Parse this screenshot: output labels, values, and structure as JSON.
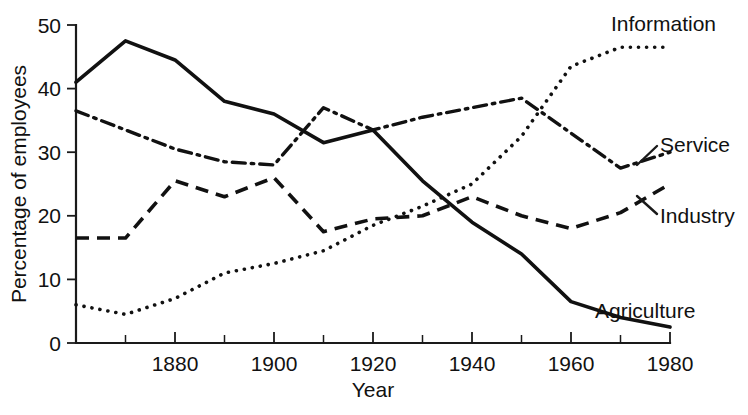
{
  "chart_data": {
    "type": "line",
    "title": "",
    "xlabel": "Year",
    "ylabel": "Percentage of employees",
    "xlim": [
      1860,
      1980
    ],
    "ylim": [
      0,
      50
    ],
    "grid": false,
    "legend_position": "inline-right-labels",
    "x_ticks_major": [
      1880,
      1900,
      1920,
      1940,
      1960,
      1980
    ],
    "x_ticks_minor": [
      1870,
      1890,
      1910,
      1930,
      1950,
      1970
    ],
    "y_ticks": [
      0,
      10,
      20,
      30,
      40,
      50
    ],
    "x": [
      1860,
      1870,
      1880,
      1890,
      1900,
      1910,
      1920,
      1930,
      1940,
      1950,
      1960,
      1970,
      1980
    ],
    "series": [
      {
        "name": "Agriculture",
        "style": "solid",
        "label": "Agriculture",
        "values": [
          41,
          47.5,
          44.5,
          38,
          36,
          31.5,
          33.5,
          25.5,
          19,
          14,
          6.5,
          4,
          2.5
        ]
      },
      {
        "name": "Service",
        "style": "dash-dot",
        "label": "Service",
        "values": [
          36.5,
          33.5,
          30.5,
          28.5,
          28,
          37,
          33.5,
          35.5,
          37,
          38.5,
          33,
          27.5,
          30
        ]
      },
      {
        "name": "Industry",
        "style": "dashed",
        "label": "Industry",
        "values": [
          16.5,
          16.5,
          25.5,
          23,
          26,
          17.5,
          19.5,
          20,
          23,
          20,
          18,
          20.5,
          25
        ]
      },
      {
        "name": "Information",
        "style": "dotted",
        "label": "Information",
        "values": [
          6,
          4.5,
          7,
          11,
          12.5,
          14.5,
          18.5,
          21.5,
          25,
          32.5,
          43.5,
          46.5,
          46.5
        ]
      }
    ]
  },
  "axes": {
    "y_tick_labels": [
      "0",
      "10",
      "20",
      "30",
      "40",
      "50"
    ],
    "x_tick_labels": [
      "1880",
      "1900",
      "1920",
      "1940",
      "1960",
      "1980"
    ],
    "x_axis_title": "Year",
    "y_axis_title": "Percentage of employees"
  },
  "labels": {
    "information": "Information",
    "service": "Service",
    "industry": "Industry",
    "agriculture": "Agriculture"
  },
  "colors": {
    "ink": "#111111",
    "background": "#ffffff"
  }
}
